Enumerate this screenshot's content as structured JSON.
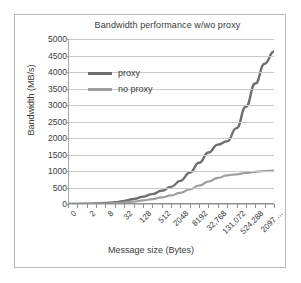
{
  "chart_data": {
    "type": "line",
    "title": "Bandwidth performance w/wo proxy",
    "xlabel": "Message size (Bytes)",
    "ylabel": "Bandwidth (MB/s)",
    "ylim": [
      0,
      5000
    ],
    "yticks": [
      0,
      500,
      1000,
      1500,
      2000,
      2500,
      3000,
      3500,
      4000,
      4500,
      5000
    ],
    "grid": true,
    "legend_position": "upper-left-inside",
    "x": [
      0,
      1,
      2,
      4,
      8,
      16,
      32,
      64,
      128,
      256,
      512,
      1024,
      2048,
      4096,
      8192,
      16384,
      32768,
      65536,
      131072,
      262144,
      524288,
      1048576,
      2097152
    ],
    "xtick_labels": [
      "0",
      "",
      "2",
      "",
      "8",
      "",
      "32",
      "",
      "128",
      "",
      "512",
      "",
      "2048",
      "",
      "8192",
      "",
      "32,768",
      "",
      "131,072",
      "",
      "524,288",
      "",
      "2097 ..."
    ],
    "xtick_labels_visible": [
      "0",
      "2",
      "8",
      "32",
      "128",
      "512",
      "2048",
      "8192",
      "32,768",
      "131,072",
      "524,288",
      "2097 ..."
    ],
    "series": [
      {
        "name": "proxy",
        "color": "#6e6e6e",
        "values": [
          2,
          4,
          8,
          16,
          30,
          55,
          95,
          150,
          220,
          300,
          400,
          520,
          700,
          950,
          1250,
          1560,
          1800,
          1900,
          2300,
          2950,
          3650,
          4250,
          4620
        ]
      },
      {
        "name": "no proxy",
        "color": "#9e9e9e",
        "values": [
          1,
          2,
          4,
          8,
          15,
          28,
          48,
          75,
          110,
          150,
          200,
          260,
          340,
          440,
          560,
          680,
          790,
          870,
          900,
          940,
          975,
          1000,
          1010
        ]
      }
    ]
  },
  "legend": {
    "entries": [
      {
        "label": "proxy"
      },
      {
        "label": "no proxy"
      }
    ]
  }
}
